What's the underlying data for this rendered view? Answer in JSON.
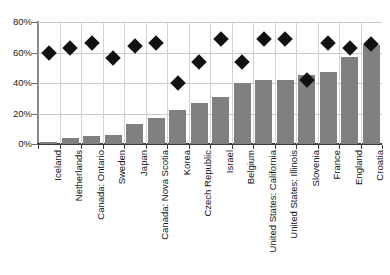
{
  "chart_data": {
    "type": "bar",
    "title": "",
    "subtitle": "",
    "xlabel": "",
    "ylabel": "",
    "ylim": [
      0,
      80
    ],
    "ytick_labels": [
      "0%",
      "20%",
      "40%",
      "60%",
      "80%"
    ],
    "ytick_values": [
      0,
      20,
      40,
      60,
      80
    ],
    "grid": true,
    "legend_position": "none",
    "categories": [
      "Iceland",
      "Netherlands",
      "Canada: Ontario",
      "Sweden",
      "Japan",
      "Canada: Nova Scotia",
      "Korea",
      "Czech Republic",
      "Israel",
      "Belgium",
      "United States: California",
      "United States: Illinois",
      "Slovenia",
      "France",
      "England",
      "Croatia"
    ],
    "series": [
      {
        "name": "Bars",
        "type": "bar",
        "color": "#808080",
        "values": [
          1,
          4,
          5,
          6,
          13,
          17,
          22,
          27,
          31,
          40,
          42,
          42,
          45,
          47,
          57,
          65
        ]
      },
      {
        "name": "Markers",
        "type": "scatter",
        "marker": "diamond",
        "color": "#111111",
        "values": [
          60,
          63,
          66,
          56.5,
          64,
          66,
          40,
          53.5,
          69,
          54,
          69,
          69,
          42,
          66,
          63,
          65.5
        ]
      }
    ]
  }
}
